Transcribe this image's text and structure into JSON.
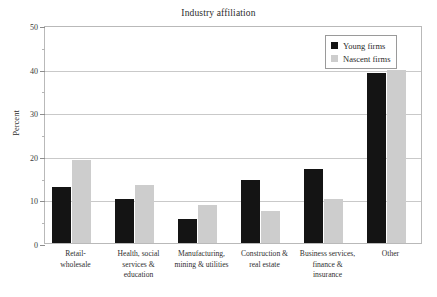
{
  "chart_data": {
    "type": "bar",
    "title": "Industry affiliation",
    "xlabel": "",
    "ylabel": "Percent",
    "ylim": [
      0,
      50
    ],
    "yticks": [
      0,
      10,
      20,
      30,
      40,
      50
    ],
    "yminor_step": 5,
    "grid": true,
    "legend_position": "top-right",
    "categories": [
      "Retail-wholesale",
      "Health, social services & education",
      "Manufacturing, mining & utilities",
      "Construction & real estate",
      "Business services, finance & insurance",
      "Other"
    ],
    "category_lines": [
      [
        "Retail-",
        "wholesale"
      ],
      [
        "Health, social",
        "services &",
        "education"
      ],
      [
        "Manufacturing,",
        "mining & utilities"
      ],
      [
        "Construction &",
        "real estate"
      ],
      [
        "Business services,",
        "finance &",
        "insurance"
      ],
      [
        "Other"
      ]
    ],
    "series": [
      {
        "name": "Young firms",
        "color": "#141414",
        "values": [
          12.8,
          10.0,
          5.4,
          14.4,
          16.9,
          39.0
        ]
      },
      {
        "name": "Nascent firms",
        "color": "#cdcdcd",
        "values": [
          19.0,
          13.3,
          8.8,
          7.3,
          10.1,
          39.6
        ]
      }
    ]
  },
  "legend": {
    "items": [
      {
        "label": "Young firms",
        "swatch": "black-square-icon"
      },
      {
        "label": "Nascent firms",
        "swatch": "gray-square-icon"
      }
    ]
  },
  "axis": {
    "y_tick_labels": [
      "0",
      "10",
      "20",
      "30",
      "40",
      "50"
    ]
  }
}
